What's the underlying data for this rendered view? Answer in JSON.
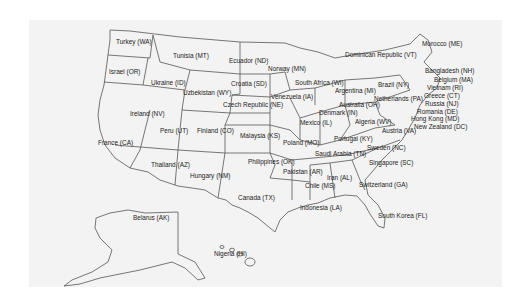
{
  "map": {
    "title": "",
    "background": "#f3f3f3",
    "stroke_color": "#555555",
    "labels": [
      {
        "id": "WA",
        "text": "Turkey (WA)",
        "x": 116,
        "y": 42
      },
      {
        "id": "OR",
        "text": "Israel (OR)",
        "x": 109,
        "y": 72
      },
      {
        "id": "MT",
        "text": "Tunisia (MT)",
        "x": 173,
        "y": 56
      },
      {
        "id": "ID",
        "text": "Ukraine (ID)",
        "x": 151,
        "y": 83
      },
      {
        "id": "WY",
        "text": "Uzbekistan (WY)",
        "x": 183,
        "y": 93
      },
      {
        "id": "ND",
        "text": "Ecuador (ND)",
        "x": 229,
        "y": 61
      },
      {
        "id": "SD",
        "text": "Croatia (SD)",
        "x": 231,
        "y": 84
      },
      {
        "id": "NE",
        "text": "Czech Republic (NE)",
        "x": 223,
        "y": 105
      },
      {
        "id": "NV",
        "text": "Ireland (NV)",
        "x": 130,
        "y": 114
      },
      {
        "id": "UT",
        "text": "Peru (UT)",
        "x": 160,
        "y": 131
      },
      {
        "id": "CO",
        "text": "Finland (CO)",
        "x": 197,
        "y": 131
      },
      {
        "id": "KS",
        "text": "Malaysia (KS)",
        "x": 240,
        "y": 136
      },
      {
        "id": "CA",
        "text": "France (CA)",
        "x": 98,
        "y": 143
      },
      {
        "id": "AZ",
        "text": "Thailand (AZ)",
        "x": 151,
        "y": 165
      },
      {
        "id": "NM",
        "text": "Hungary (NM)",
        "x": 190,
        "y": 176
      },
      {
        "id": "OK",
        "text": "Philippines (OK)",
        "x": 248,
        "y": 162
      },
      {
        "id": "TX",
        "text": "Canada (TX)",
        "x": 238,
        "y": 198
      },
      {
        "id": "MN",
        "text": "Norway (MN)",
        "x": 268,
        "y": 69
      },
      {
        "id": "IA",
        "text": "Venezuela (IA)",
        "x": 271,
        "y": 97
      },
      {
        "id": "MO",
        "text": "Poland (MO)",
        "x": 283,
        "y": 143
      },
      {
        "id": "IL",
        "text": "Mexico (IL)",
        "x": 300,
        "y": 123
      },
      {
        "id": "WI",
        "text": "South Africa (WI)",
        "x": 295,
        "y": 83
      },
      {
        "id": "MI",
        "text": "Argentina (MI)",
        "x": 335,
        "y": 91
      },
      {
        "id": "VT",
        "text": "Dominican Republic (VT)",
        "x": 345,
        "y": 55
      },
      {
        "id": "NY",
        "text": "Brazil (NY)",
        "x": 378,
        "y": 85
      },
      {
        "id": "PA",
        "text": "Netherlands (PA)",
        "x": 374,
        "y": 99
      },
      {
        "id": "OH",
        "text": "Australia (OH)",
        "x": 339,
        "y": 105
      },
      {
        "id": "IN",
        "text": "Denmark (IN)",
        "x": 319,
        "y": 113
      },
      {
        "id": "WV",
        "text": "Algeria (WV)",
        "x": 355,
        "y": 122
      },
      {
        "id": "KY",
        "text": "Portugal (KY)",
        "x": 334,
        "y": 139
      },
      {
        "id": "VA",
        "text": "Austria (VA)",
        "x": 382,
        "y": 131
      },
      {
        "id": "TN",
        "text": "Saudi Arabia (TN)",
        "x": 315,
        "y": 154
      },
      {
        "id": "NC",
        "text": "Sweden (NC)",
        "x": 367,
        "y": 148
      },
      {
        "id": "SC",
        "text": "Singapore (SC)",
        "x": 369,
        "y": 163
      },
      {
        "id": "AR",
        "text": "Pakistan (AR)",
        "x": 283,
        "y": 172
      },
      {
        "id": "AL",
        "text": "Iran (AL)",
        "x": 327,
        "y": 178
      },
      {
        "id": "MS",
        "text": "Chile (MS)",
        "x": 305,
        "y": 186
      },
      {
        "id": "GA",
        "text": "Switzerland (GA)",
        "x": 359,
        "y": 185
      },
      {
        "id": "LA",
        "text": "Indonesia (LA)",
        "x": 300,
        "y": 208
      },
      {
        "id": "FL",
        "text": "South Korea (FL)",
        "x": 378,
        "y": 216
      },
      {
        "id": "ME",
        "text": "Morocco (ME)",
        "x": 422,
        "y": 44
      },
      {
        "id": "NH",
        "text": "Bangladesh (NH)",
        "x": 425,
        "y": 71
      },
      {
        "id": "MA",
        "text": "Belgium (MA)",
        "x": 434,
        "y": 80
      },
      {
        "id": "RI",
        "text": "Vietnam (RI)",
        "x": 427,
        "y": 88
      },
      {
        "id": "CT",
        "text": "Greece (CT)",
        "x": 424,
        "y": 96
      },
      {
        "id": "NJ",
        "text": "Russia (NJ)",
        "x": 425,
        "y": 104
      },
      {
        "id": "DE",
        "text": "Romania (DE)",
        "x": 417,
        "y": 112
      },
      {
        "id": "MD",
        "text": "Hong Kong (MD)",
        "x": 411,
        "y": 119
      },
      {
        "id": "DC",
        "text": "New Zealand (DC)",
        "x": 414,
        "y": 127
      },
      {
        "id": "AK",
        "text": "Belarus (AK)",
        "x": 133,
        "y": 218
      },
      {
        "id": "HI",
        "text": "Nigeria (HI)",
        "x": 214,
        "y": 254
      }
    ]
  }
}
